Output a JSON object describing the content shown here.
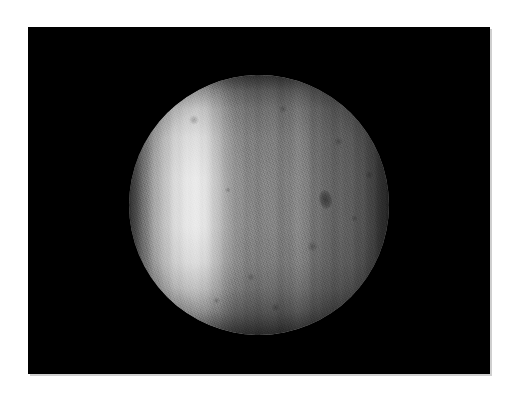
{
  "figure": {
    "kind": "astronomical-image",
    "caption": "",
    "page_background": "#ffffff",
    "plate_background": "#000000"
  },
  "plate": {
    "label": "image-plate",
    "x": 28,
    "y": 27,
    "width": 462,
    "height": 347,
    "border_color": "#cfcfcf"
  },
  "disk": {
    "label": "planetary-disk",
    "center_x": 259,
    "center_y": 205,
    "radius": 130,
    "brightest_gray": "#ececec",
    "midtone_gray": "#787878",
    "limb_gray": "#202020",
    "bright_band_position_pct": 24,
    "features": [
      {
        "name": "bright-limb-band",
        "description": "bright vertical band near west limb"
      },
      {
        "name": "central-bright-lane",
        "description": "narrow bright vertical lane right of center"
      },
      {
        "name": "dark-spot",
        "description": "small dark oval spot on eastern hemisphere",
        "x": 326,
        "y": 198,
        "width": 13,
        "height": 19
      },
      {
        "name": "vertical-banding",
        "description": "faint vertical striping across disk"
      }
    ]
  },
  "mottles": [
    {
      "left": 60,
      "top": 40,
      "size": 10
    },
    {
      "left": 150,
      "top": 30,
      "size": 8
    },
    {
      "left": 205,
      "top": 62,
      "size": 9
    },
    {
      "left": 178,
      "top": 166,
      "size": 11
    },
    {
      "left": 118,
      "top": 198,
      "size": 8
    },
    {
      "left": 222,
      "top": 140,
      "size": 7
    },
    {
      "left": 96,
      "top": 112,
      "size": 6
    },
    {
      "left": 236,
      "top": 96,
      "size": 8
    },
    {
      "left": 142,
      "top": 228,
      "size": 9
    },
    {
      "left": 84,
      "top": 222,
      "size": 7
    }
  ]
}
